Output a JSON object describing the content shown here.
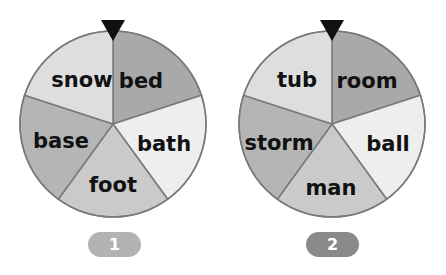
{
  "wheels": [
    {
      "id": 1,
      "badge_label": "1",
      "badge_color": "#b3b3b3",
      "segments": [
        {
          "label": "bed",
          "color": "#a9a9a9"
        },
        {
          "label": "bath",
          "color": "#eeeeee"
        },
        {
          "label": "foot",
          "color": "#cacaca"
        },
        {
          "label": "base",
          "color": "#b5b5b5"
        },
        {
          "label": "snow",
          "color": "#dedede"
        }
      ]
    },
    {
      "id": 2,
      "badge_label": "2",
      "badge_color": "#8a8a8a",
      "segments": [
        {
          "label": "room",
          "color": "#a9a9a9"
        },
        {
          "label": "ball",
          "color": "#eeeeee"
        },
        {
          "label": "man",
          "color": "#cacaca"
        },
        {
          "label": "storm",
          "color": "#b5b5b5"
        },
        {
          "label": "tub",
          "color": "#dedede"
        }
      ]
    }
  ],
  "pointer_color": "#111111",
  "outline_color": "#7a7a7a"
}
